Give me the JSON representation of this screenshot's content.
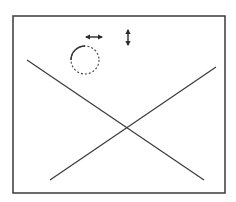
{
  "diagram": {
    "background": "#ffffff",
    "stroke_color": "#3a3a3a",
    "frame": {
      "x": 13,
      "y": 16,
      "width": 212,
      "height": 177
    },
    "lines": [
      {
        "name": "diagonal-line-descending",
        "x1": 27,
        "y1": 60,
        "x2": 204,
        "y2": 180
      },
      {
        "name": "diagonal-line-ascending",
        "x1": 50,
        "y1": 180,
        "x2": 216,
        "y2": 67
      }
    ],
    "circle": {
      "cx": 85,
      "cy": 60,
      "r": 14,
      "solid_arc": "top-left",
      "rest": "dashed"
    },
    "arrows": [
      {
        "name": "horizontal-double-arrow-icon",
        "orientation": "horizontal",
        "x1": 85,
        "y1": 37,
        "x2": 103,
        "y2": 37
      },
      {
        "name": "vertical-double-arrow-icon",
        "orientation": "vertical",
        "x1": 128,
        "y1": 29,
        "x2": 128,
        "y2": 46
      }
    ]
  }
}
